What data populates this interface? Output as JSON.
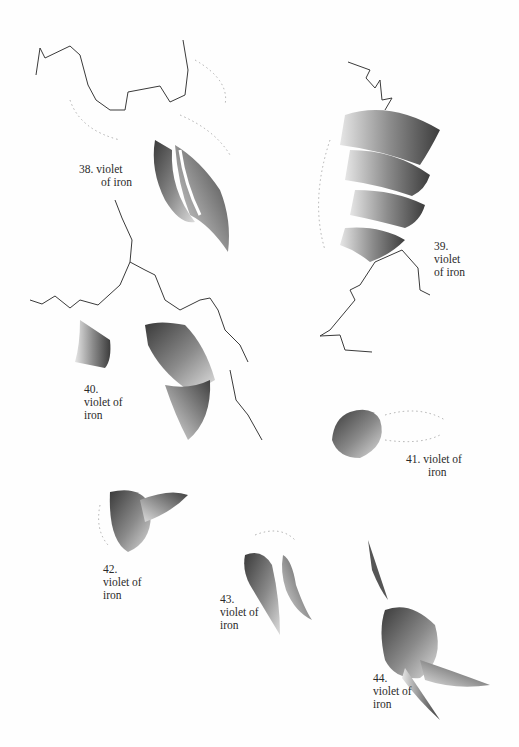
{
  "page": {
    "background": "#fefefe",
    "ink_color": "#2a2a2a",
    "stroke_colors": [
      "#3a3a3a",
      "#6e6e6e",
      "#a8a8a8",
      "#d6d6d6"
    ]
  },
  "figures": [
    {
      "number": "38.",
      "lines": [
        "38.  violet",
        "of iron"
      ]
    },
    {
      "number": "39.",
      "lines": [
        "39.",
        "violet",
        "of  iron"
      ]
    },
    {
      "number": "40.",
      "lines": [
        "40.",
        "violet of",
        "iron"
      ]
    },
    {
      "number": "41.",
      "lines": [
        "41.  violet  of",
        "iron"
      ]
    },
    {
      "number": "42.",
      "lines": [
        "42.",
        "violet   of",
        "iron"
      ]
    },
    {
      "number": "43.",
      "lines": [
        "43.",
        "violet of",
        "iron"
      ]
    },
    {
      "number": "44.",
      "lines": [
        "44.",
        "violet of",
        "iron"
      ]
    }
  ]
}
